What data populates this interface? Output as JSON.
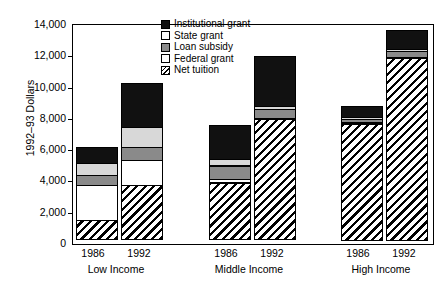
{
  "chart_data": {
    "type": "bar",
    "subtype": "stacked-bar-grouped",
    "title": "",
    "xlabel": "",
    "ylabel": "1992–93 Dollars",
    "ylim": [
      0,
      14000
    ],
    "ytick_labels": [
      "14,000",
      "12,000",
      "10,000",
      "8,000",
      "6,000",
      "4,000",
      "2,000",
      "0"
    ],
    "ytick_values": [
      14000,
      12000,
      10000,
      8000,
      6000,
      4000,
      2000,
      0
    ],
    "grid": false,
    "legend_position": "top-center",
    "groups": [
      {
        "name": "Low Income",
        "years": [
          "1986",
          "1992"
        ]
      },
      {
        "name": "Middle Income",
        "years": [
          "1986",
          "1992"
        ]
      },
      {
        "name": "High Income",
        "years": [
          "1986",
          "1992"
        ]
      }
    ],
    "categories": [
      "Low Income 1986",
      "Low Income 1992",
      "Middle Income 1986",
      "Middle Income 1992",
      "High Income 1986",
      "High Income 1992"
    ],
    "series": [
      {
        "name": "Net tuition",
        "key": "nettuition",
        "swatch": "diagonal-hatch",
        "color": "#ffffff",
        "values": [
          1300,
          3550,
          3700,
          7750,
          7500,
          11700
        ]
      },
      {
        "name": "Federal grant",
        "key": "federal",
        "swatch": "white",
        "color": "#ffffff",
        "values": [
          2300,
          1650,
          300,
          150,
          100,
          100
        ]
      },
      {
        "name": "Loan subsidy",
        "key": "loan",
        "swatch": "gray",
        "color": "#8a8a8a",
        "values": [
          700,
          900,
          900,
          600,
          300,
          400
        ]
      },
      {
        "name": "State grant",
        "key": "state",
        "swatch": "light-gray",
        "color": "#d8d8d8",
        "values": [
          800,
          1300,
          500,
          250,
          150,
          200
        ]
      },
      {
        "name": "Institutional grant",
        "key": "institutional",
        "swatch": "black",
        "color": "#111111",
        "values": [
          1100,
          2900,
          2200,
          3250,
          750,
          1300
        ]
      }
    ],
    "totals": [
      7200,
      10300,
      7600,
      12000,
      8800,
      13700
    ]
  },
  "legend": {
    "entries": [
      {
        "label": "Institutional grant",
        "key": "institutional"
      },
      {
        "label": "State grant",
        "key": "state"
      },
      {
        "label": "Loan subsidy",
        "key": "loan"
      },
      {
        "label": "Federal grant",
        "key": "federal"
      },
      {
        "label": "Net tuition",
        "key": "nettuition"
      }
    ]
  }
}
